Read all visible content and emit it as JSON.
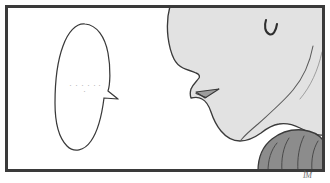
{
  "panel": {
    "kind": "comic-panel",
    "caption": "",
    "border_color": "#3a3a3a",
    "background_color": "#ffffff",
    "border_width_px": 3,
    "frame": {
      "x": 5,
      "y": 5,
      "width": 320,
      "height": 167
    }
  },
  "speech_bubble": {
    "name": "speech-balloon",
    "text": "・・・・・・\n・",
    "outline_color": "#3a3a3a",
    "fill_color": "#ffffff",
    "text_color": "#b9b9b9",
    "tail_direction": "right"
  },
  "character": {
    "name": "profile-face",
    "view": "side-profile-left-facing",
    "skin_fill": "#e2e2e2",
    "outline_color": "#3a3a3a",
    "lip_fill": "#9d9d9d",
    "ear_mark_color": "#2e2e2e",
    "clothing_fill": "#8c8c8c",
    "clothing_outline": "#3a3a3a",
    "parts": [
      "forehead",
      "brow",
      "nose",
      "upper-lip",
      "mouth",
      "lower-lip",
      "chin",
      "jaw",
      "neck",
      "ear",
      "shoulder-garment"
    ]
  },
  "signature": {
    "text": "ÌM",
    "color": "#6d6d6d"
  }
}
